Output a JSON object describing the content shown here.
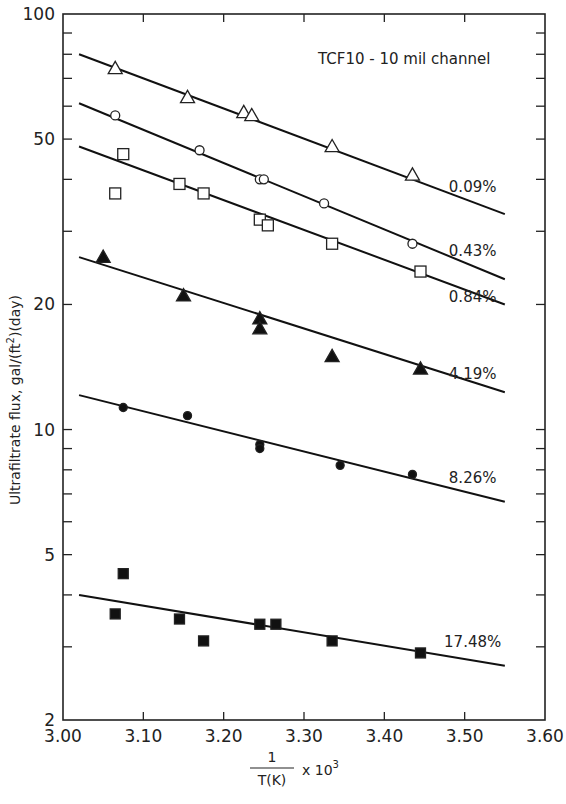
{
  "chart_data": {
    "type": "scatter",
    "title": "TCF10 - 10 mil channel",
    "xlabel": "1/T(K) x 10^3",
    "xlabel_parts": {
      "numerator": "1",
      "denominator": "T(K)",
      "suffix": "x 10",
      "exponent": "3"
    },
    "ylabel": "Ultrafiltrate flux, gal/(ft^2)(day)",
    "ylabel_parts": {
      "main": "Ultrafiltrate flux, gal/(ft",
      "sup": "2",
      "tail": ")(day)"
    },
    "xlim": [
      3.0,
      3.6
    ],
    "ylim": [
      2,
      100
    ],
    "yscale": "log",
    "grid": false,
    "legend": "inline labels at right of each fit line",
    "x_ticks": [
      3.0,
      3.1,
      3.2,
      3.3,
      3.4,
      3.5,
      3.6
    ],
    "x_tick_labels": [
      "3.00",
      "3.10",
      "3.20",
      "3.30",
      "3.40",
      "3.50",
      "3.60"
    ],
    "y_ticks_labeled": [
      2,
      5,
      10,
      20,
      50,
      100
    ],
    "y_tick_labels": [
      "2",
      "5",
      "10",
      "20",
      "50",
      "100"
    ],
    "y_ticks_minor": [
      3,
      4,
      6,
      7,
      8,
      9,
      30,
      40,
      60,
      70,
      80,
      90
    ],
    "series": [
      {
        "name": "0.09%",
        "marker": "triangle-open",
        "points": [
          [
            3.065,
            74
          ],
          [
            3.155,
            63
          ],
          [
            3.225,
            58
          ],
          [
            3.235,
            57
          ],
          [
            3.335,
            48
          ],
          [
            3.435,
            41
          ]
        ],
        "fit": [
          [
            3.02,
            80
          ],
          [
            3.55,
            33
          ]
        ],
        "label_pos": [
          3.5,
          38.5
        ]
      },
      {
        "name": "0.43%",
        "marker": "circle-open",
        "points": [
          [
            3.065,
            57
          ],
          [
            3.17,
            47
          ],
          [
            3.245,
            40
          ],
          [
            3.25,
            40
          ],
          [
            3.325,
            35
          ],
          [
            3.435,
            28
          ]
        ],
        "fit": [
          [
            3.02,
            61
          ],
          [
            3.55,
            23
          ]
        ],
        "label_pos": [
          3.5,
          27
        ]
      },
      {
        "name": "0.84%",
        "marker": "square-open",
        "points": [
          [
            3.065,
            37
          ],
          [
            3.075,
            46
          ],
          [
            3.145,
            39
          ],
          [
            3.175,
            37
          ],
          [
            3.245,
            32
          ],
          [
            3.255,
            31
          ],
          [
            3.335,
            28
          ],
          [
            3.445,
            24
          ]
        ],
        "fit": [
          [
            3.02,
            48
          ],
          [
            3.55,
            20
          ]
        ],
        "label_pos": [
          3.5,
          21
        ]
      },
      {
        "name": "4.19%",
        "marker": "triangle-filled",
        "points": [
          [
            3.05,
            26
          ],
          [
            3.15,
            21
          ],
          [
            3.245,
            18.5
          ],
          [
            3.245,
            17.5
          ],
          [
            3.335,
            15
          ],
          [
            3.445,
            14
          ]
        ],
        "fit": [
          [
            3.02,
            26
          ],
          [
            3.55,
            12.3
          ]
        ],
        "label_pos": [
          3.5,
          13.7
        ]
      },
      {
        "name": "8.26%",
        "marker": "circle-filled",
        "points": [
          [
            3.075,
            11.3
          ],
          [
            3.155,
            10.8
          ],
          [
            3.245,
            9.2
          ],
          [
            3.245,
            9.0
          ],
          [
            3.345,
            8.2
          ],
          [
            3.435,
            7.8
          ]
        ],
        "fit": [
          [
            3.02,
            12.1
          ],
          [
            3.55,
            6.7
          ]
        ],
        "label_pos": [
          3.5,
          7.7
        ]
      },
      {
        "name": "17.48%",
        "marker": "square-filled",
        "points": [
          [
            3.065,
            3.6
          ],
          [
            3.075,
            4.5
          ],
          [
            3.145,
            3.5
          ],
          [
            3.175,
            3.1
          ],
          [
            3.245,
            3.4
          ],
          [
            3.265,
            3.4
          ],
          [
            3.335,
            3.1
          ],
          [
            3.445,
            2.9
          ]
        ],
        "fit": [
          [
            3.02,
            4.0
          ],
          [
            3.55,
            2.7
          ]
        ],
        "label_pos": [
          3.5,
          3.1
        ]
      }
    ]
  }
}
